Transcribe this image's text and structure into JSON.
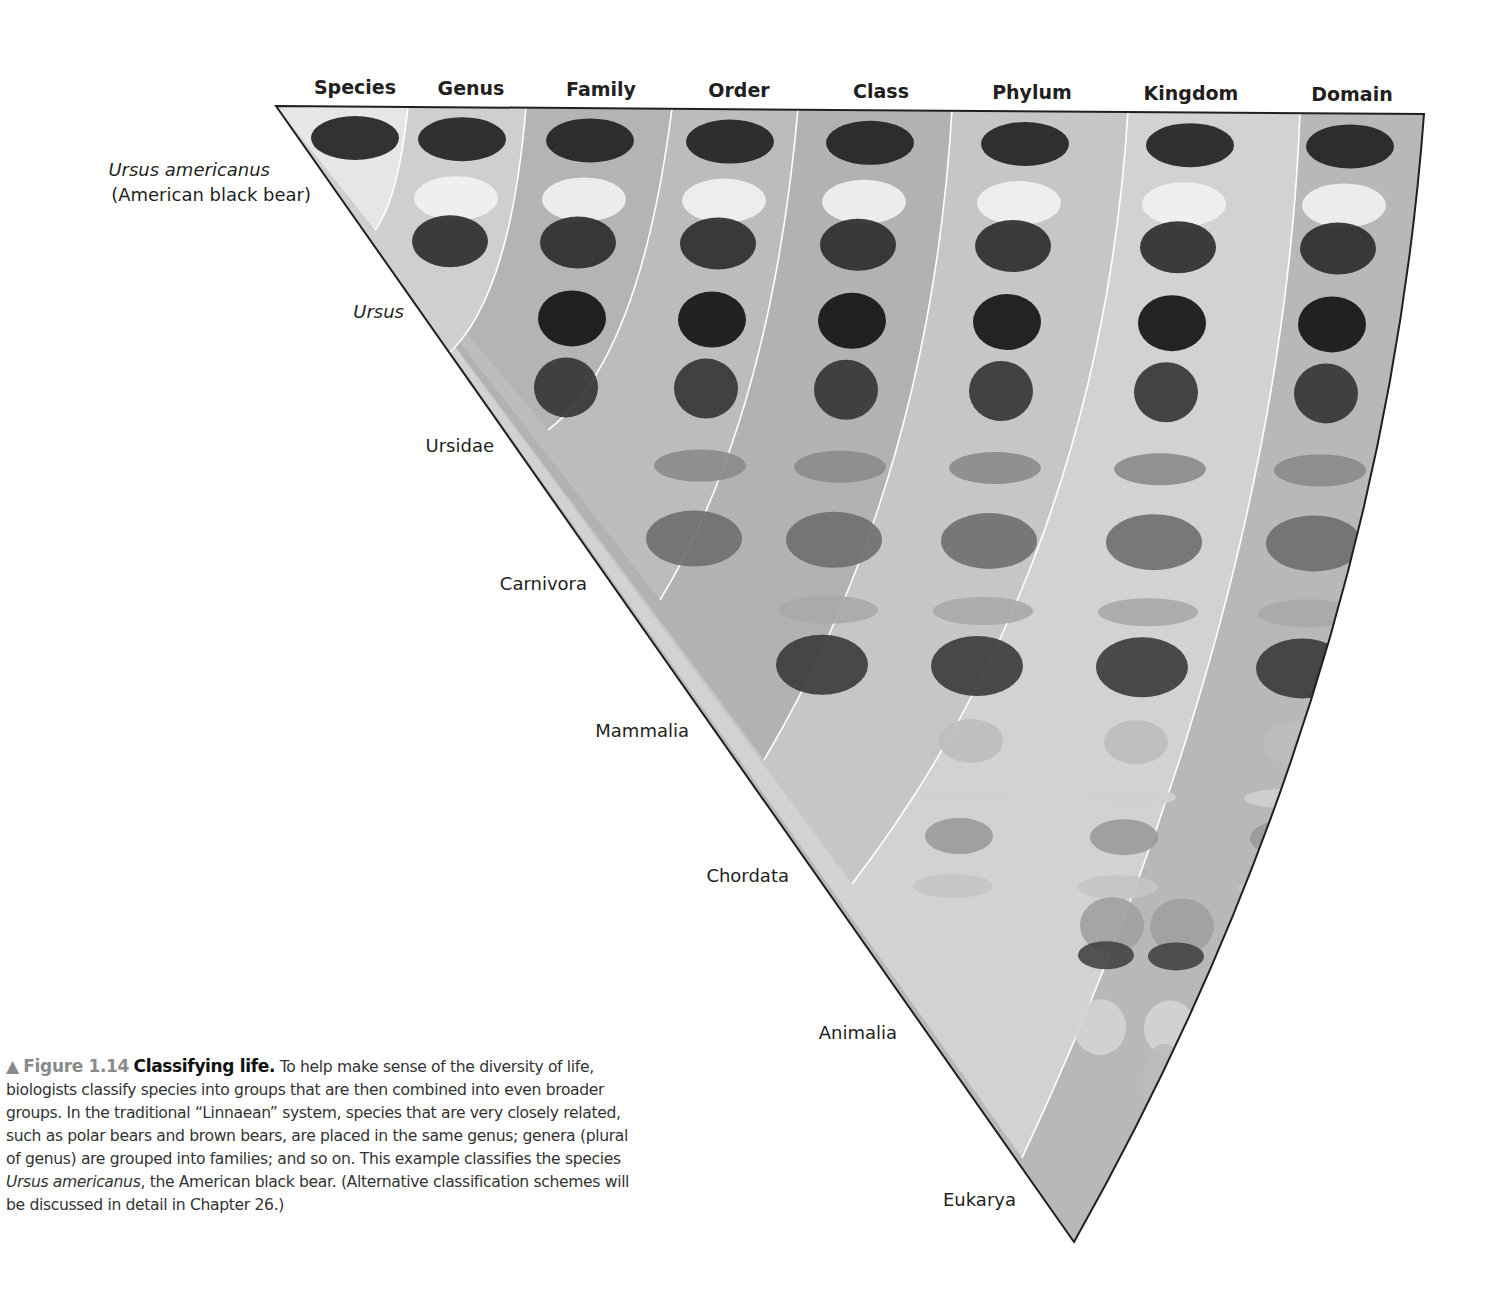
{
  "figure": {
    "column_headers": [
      "Species",
      "Genus",
      "Family",
      "Order",
      "Class",
      "Phylum",
      "Kingdom",
      "Domain"
    ],
    "taxon_labels": [
      {
        "rank": "Species",
        "name": "Ursus americanus",
        "common_name": "(American black bear)",
        "italic": true
      },
      {
        "rank": "Genus",
        "name": "Ursus",
        "italic": true
      },
      {
        "rank": "Family",
        "name": "Ursidae",
        "italic": false
      },
      {
        "rank": "Order",
        "name": "Carnivora",
        "italic": false
      },
      {
        "rank": "Class",
        "name": "Mammalia",
        "italic": false
      },
      {
        "rank": "Phylum",
        "name": "Chordata",
        "italic": false
      },
      {
        "rank": "Kingdom",
        "name": "Animalia",
        "italic": false
      },
      {
        "rank": "Domain",
        "name": "Eukarya",
        "italic": false
      }
    ],
    "organisms": [
      "American black bear",
      "Polar bear",
      "Brown bear",
      "Giant panda",
      "Spectacled bear",
      "Leopard",
      "Gray wolf",
      "Dolphin",
      "Zebra",
      "Frog",
      "Gull",
      "Turtle",
      "Fish",
      "Sea star",
      "Butterfly",
      "Sponge",
      "Daffodil",
      "Mushroom",
      "Protist"
    ],
    "band_colors": {
      "species": "#e6e6e6",
      "genus": "#cfcfcf",
      "family": "#b4b4b4",
      "order": "#bcbcbc",
      "class": "#b2b2b2",
      "phylum": "#c6c6c6",
      "kingdom": "#d2d2d2",
      "domain": "#b8b8b8"
    },
    "outline_color": "#231f20",
    "divider_color": "#ffffff"
  },
  "caption": {
    "marker": "▲",
    "figure_number": "Figure 1.14",
    "title": "Classifying life.",
    "text_part1": "To help make sense of the diversity of life, biologists classify species into groups that are then combined into even broader groups. In the traditional “Linnaean” system, species that are very closely related, such as polar bears and brown bears, are placed in the same genus; genera (plural of genus) are grouped into families; and so on. This example classifies the species ",
    "species_italic": "Ursus americanus",
    "text_part2": ", the American black bear. (Alternative classification schemes will be discussed in detail in Chapter 26.)"
  }
}
